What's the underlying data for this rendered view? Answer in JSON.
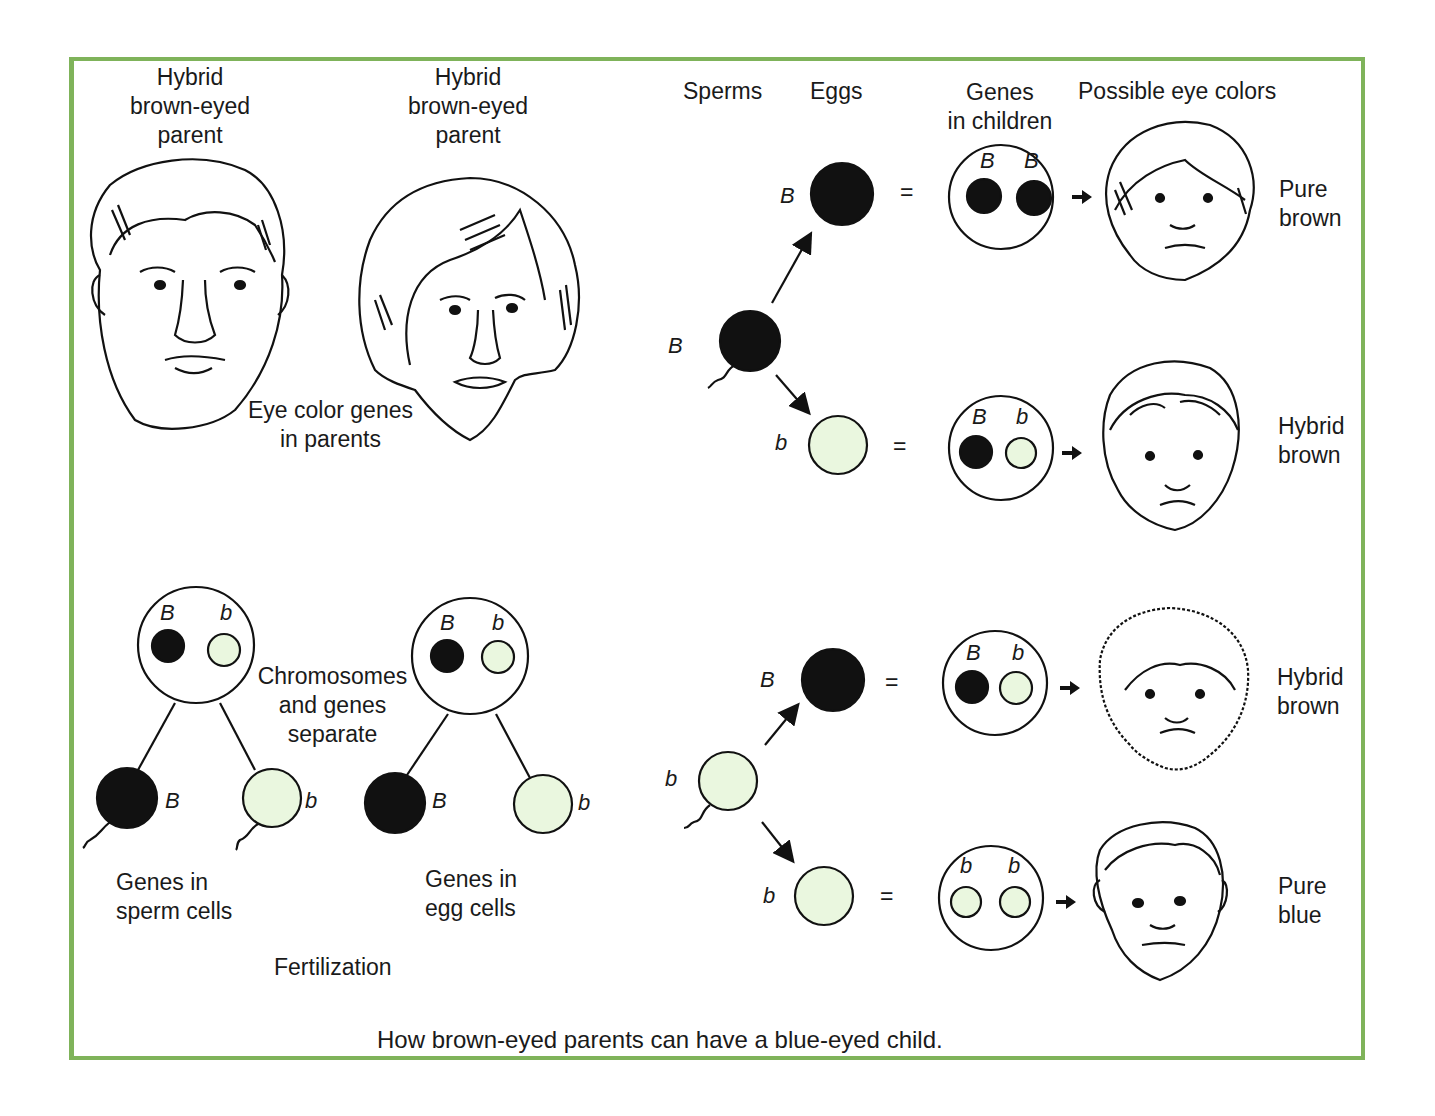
{
  "colors": {
    "border": "#7fb35a",
    "dominant_fill": "#111111",
    "recessive_fill": "#eaf7df",
    "stroke": "#111111"
  },
  "parents": {
    "father_label": [
      "Hybrid",
      "brown-eyed",
      "parent"
    ],
    "mother_label": [
      "Hybrid",
      "brown-eyed",
      "parent"
    ],
    "genes_label": [
      "Eye color genes",
      "in parents"
    ]
  },
  "meiosis": {
    "separate_label": [
      "Chromosomes",
      "and genes",
      "separate"
    ],
    "sperm_parent": {
      "genes": [
        "B",
        "b"
      ]
    },
    "egg_parent": {
      "genes": [
        "B",
        "b"
      ]
    },
    "sperm_cells": [
      {
        "gene": "B",
        "type": "dominant"
      },
      {
        "gene": "b",
        "type": "recessive"
      }
    ],
    "egg_cells": [
      {
        "gene": "B",
        "type": "dominant"
      },
      {
        "gene": "b",
        "type": "recessive"
      }
    ],
    "sperm_caption": [
      "Genes in",
      "sperm cells"
    ],
    "egg_caption": [
      "Genes in",
      "egg cells"
    ],
    "fertilization_label": "Fertilization"
  },
  "headers": {
    "sperms": "Sperms",
    "eggs": "Eggs",
    "genes_in_children": [
      "Genes",
      "in children"
    ],
    "possible_colors": "Possible eye colors"
  },
  "crosses": [
    {
      "sperm": "B",
      "egg": "B",
      "child_genes": [
        "B",
        "B"
      ],
      "result": [
        "Pure",
        "brown"
      ]
    },
    {
      "sperm": "B",
      "egg": "b",
      "child_genes": [
        "B",
        "b"
      ],
      "result": [
        "Hybrid",
        "brown"
      ]
    },
    {
      "sperm": "b",
      "egg": "B",
      "child_genes": [
        "B",
        "b"
      ],
      "result": [
        "Hybrid",
        "brown"
      ]
    },
    {
      "sperm": "b",
      "egg": "b",
      "child_genes": [
        "b",
        "b"
      ],
      "result": [
        "Pure",
        "blue"
      ]
    }
  ],
  "symbols": {
    "equals": "=",
    "arrow": "→"
  },
  "caption": "How brown-eyed parents can have a blue-eyed child."
}
